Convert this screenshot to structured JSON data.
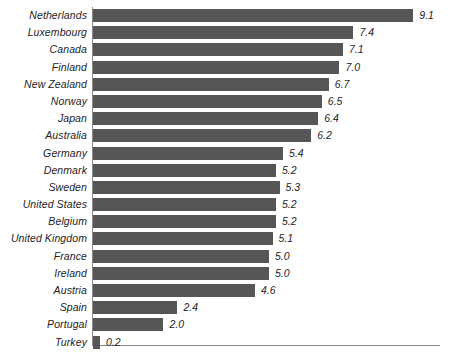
{
  "chart_data": {
    "type": "bar",
    "orientation": "horizontal",
    "title": "",
    "subtitle": "",
    "xlabel": "",
    "ylabel": "",
    "xlim": [
      0,
      9.1
    ],
    "grid": false,
    "legend": null,
    "bar_color": "#565656",
    "axis_color": "#8a8a8a",
    "label_color": "#1d1d1d",
    "value_label_format": "one-decimal",
    "categories": [
      "Netherlands",
      "Luxembourg",
      "Canada",
      "Finland",
      "New Zealand",
      "Norway",
      "Japan",
      "Australia",
      "Germany",
      "Denmark",
      "Sweden",
      "United States",
      "Belgium",
      "United Kingdom",
      "France",
      "Ireland",
      "Austria",
      "Spain",
      "Portugal",
      "Turkey"
    ],
    "values": [
      9.1,
      7.4,
      7.1,
      7.0,
      6.7,
      6.5,
      6.4,
      6.2,
      5.4,
      5.2,
      5.3,
      5.2,
      5.2,
      5.1,
      5.0,
      5.0,
      4.6,
      2.4,
      2.0,
      0.2
    ],
    "value_labels": [
      "9.1",
      "7.4",
      "7.1",
      "7.0",
      "6.7",
      "6.5",
      "6.4",
      "6.2",
      "5.4",
      "5.2",
      "5.3",
      "5.2",
      "5.2",
      "5.1",
      "5.0",
      "5.0",
      "4.6",
      "2.4",
      "2.0",
      "0.2"
    ]
  }
}
